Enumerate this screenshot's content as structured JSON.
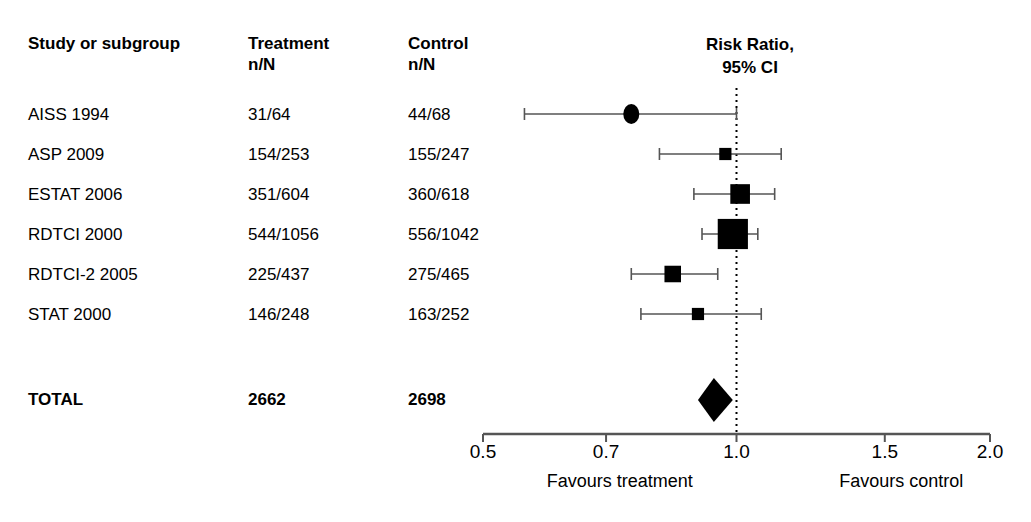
{
  "table": {
    "headers": {
      "study": "Study or subgroup",
      "treatment": "Treatment\nn/N",
      "control": "Control\nn/N"
    },
    "rows": [
      {
        "study": "AISS 1994",
        "treatment": "31/64",
        "control": "44/68"
      },
      {
        "study": "ASP 2009",
        "treatment": "154/253",
        "control": "155/247"
      },
      {
        "study": "ESTAT 2006",
        "treatment": "351/604",
        "control": "360/618"
      },
      {
        "study": "RDTCI 2000",
        "treatment": "544/1056",
        "control": "556/1042"
      },
      {
        "study": "RDTCI-2 2005",
        "treatment": "225/437",
        "control": "275/465"
      },
      {
        "study": "STAT 2000",
        "treatment": "146/248",
        "control": "163/252"
      }
    ],
    "total": {
      "study": "TOTAL",
      "treatment": "2662",
      "control": "2698"
    }
  },
  "chart_data": {
    "type": "scatter",
    "subtype": "forest-plot",
    "title": "Risk Ratio,\n95% CI",
    "xlabel": "",
    "ylabel": "",
    "xscale": "log",
    "xlim": [
      0.5,
      2.0
    ],
    "grid": false,
    "reference_line": {
      "value": 1.0,
      "style": "dotted"
    },
    "tick_labels": [
      "0.5",
      "0.7",
      "1.0",
      "1.5",
      "2.0"
    ],
    "tick_values": [
      0.5,
      0.7,
      1.0,
      1.5,
      2.0
    ],
    "left_annotation": "Favours treatment",
    "right_annotation": "Favours control",
    "effect_measure": "Risk Ratio",
    "confidence_level": "95% CI",
    "points": [
      {
        "label": "AISS 1994",
        "estimate": 0.75,
        "ci_low": 0.56,
        "ci_high": 1.0,
        "marker": "circle",
        "weight": 2
      },
      {
        "label": "ASP 2009",
        "estimate": 0.97,
        "ci_low": 0.81,
        "ci_high": 1.13,
        "marker": "square",
        "weight": 10
      },
      {
        "label": "ESTAT 2006",
        "estimate": 1.01,
        "ci_low": 0.89,
        "ci_high": 1.11,
        "marker": "square",
        "weight": 22
      },
      {
        "label": "RDTCI 2000",
        "estimate": 0.99,
        "ci_low": 0.91,
        "ci_high": 1.06,
        "marker": "square",
        "weight": 39
      },
      {
        "label": "RDTCI-2 2005",
        "estimate": 0.84,
        "ci_low": 0.75,
        "ci_high": 0.95,
        "marker": "square",
        "weight": 17
      },
      {
        "label": "STAT 2000",
        "estimate": 0.9,
        "ci_low": 0.77,
        "ci_high": 1.07,
        "marker": "square",
        "weight": 10
      }
    ],
    "summary": {
      "label": "TOTAL",
      "estimate": 0.94,
      "ci_low": 0.9,
      "ci_high": 0.99,
      "marker": "diamond"
    }
  },
  "colors": {
    "marker": "#000000",
    "line": "#555555",
    "axis": "#555555",
    "text": "#000000",
    "background": "#ffffff"
  }
}
